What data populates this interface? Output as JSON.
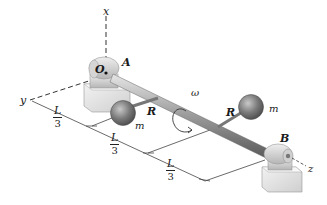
{
  "figure": {
    "colors": {
      "shaft": "#8a8a8a",
      "sphere": "#6f6f6f",
      "bearing": "#d8d8d8",
      "axis_dash": "#333333",
      "dimension_line": "#444444"
    }
  },
  "labels": {
    "axis_x": "x",
    "axis_y": "y",
    "axis_z": "z",
    "origin": "O",
    "bearing_a": "A",
    "bearing_b": "B",
    "omega": "ω",
    "arm_1": "R",
    "arm_2": "R",
    "mass_1": "m",
    "mass_2": "m"
  },
  "dimensions": [
    {
      "num": "L",
      "den": "3"
    },
    {
      "num": "L",
      "den": "3"
    },
    {
      "num": "L",
      "den": "3"
    }
  ]
}
